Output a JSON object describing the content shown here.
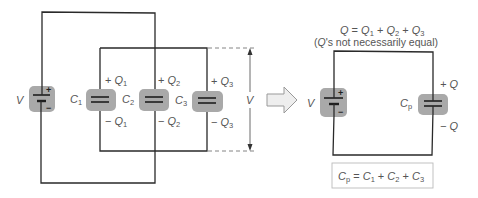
{
  "left_circuit": {
    "battery": {
      "label": "V",
      "plus": "+",
      "minus": "−"
    },
    "capacitors": [
      {
        "name": "C",
        "sub": "1",
        "top_charge_sign": "+",
        "top_charge": "Q",
        "top_sub": "1",
        "bottom_charge_sign": "−",
        "bottom_charge": "Q",
        "bottom_sub": "1"
      },
      {
        "name": "C",
        "sub": "2",
        "top_charge_sign": "+",
        "top_charge": "Q",
        "top_sub": "2",
        "bottom_charge_sign": "−",
        "bottom_charge": "Q",
        "bottom_sub": "2"
      },
      {
        "name": "C",
        "sub": "3",
        "top_charge_sign": "+",
        "top_charge": "Q",
        "top_sub": "3",
        "bottom_charge_sign": "−",
        "bottom_charge": "Q",
        "bottom_sub": "3"
      }
    ],
    "dimension_label": "V"
  },
  "equivalence_arrow": "arrow-right",
  "right_circuit": {
    "charge_equation": {
      "lhs": "Q",
      "eq": " = ",
      "t1": "Q",
      "t1_sub": "1",
      "plus1": " + ",
      "t2": "Q",
      "t2_sub": "2",
      "plus2": " + ",
      "t3": "Q",
      "t3_sub": "3"
    },
    "note": {
      "open": "(",
      "q": "Q",
      "rest": "'s not necessarily equal)"
    },
    "battery": {
      "label": "V",
      "plus": "+",
      "minus": "−"
    },
    "capacitor": {
      "name": "C",
      "sub": "p",
      "top_charge": "+ Q",
      "bottom_charge": "− Q"
    },
    "formula": {
      "lhs": "C",
      "lhs_sub": "p",
      "eq": " = ",
      "t1": "C",
      "t1_sub": "1",
      "plus1": " + ",
      "t2": "C",
      "t2_sub": "2",
      "plus2": " + ",
      "t3": "C",
      "t3_sub": "3"
    }
  },
  "colors": {
    "wire": "#2a2a2a",
    "component_pad": "#a9a9a9",
    "label": "#555555",
    "arrow_fill": "#eeeeee",
    "formula_box_border": "#bbbbbb"
  }
}
